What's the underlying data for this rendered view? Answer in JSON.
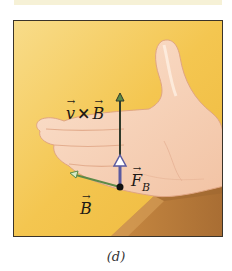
{
  "figure": {
    "panel_label": "(d)",
    "labels": {
      "v_cross_b": {
        "left": "v",
        "operator": "×",
        "right": "B"
      },
      "force": {
        "symbol": "F",
        "subscript": "B"
      },
      "field": {
        "symbol": "B"
      }
    },
    "colors": {
      "background": "#f4c44c",
      "background_light": "#f7d987",
      "skin": "#f6d2b8",
      "skin_shadow": "#e6a989",
      "table": "#b77a3a",
      "table_dark": "#9c6530",
      "frame_border": "#3a332a",
      "vxb_arrow": "#2f3a2a",
      "force_arrow": "#5a5aa0",
      "field_arrow": "#5d8a48",
      "origin_dot": "#111111"
    }
  }
}
